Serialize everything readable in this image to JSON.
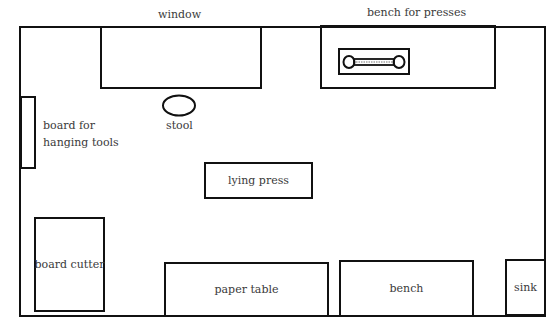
{
  "diagram": {
    "type": "floor-plan",
    "labels": {
      "window": "window",
      "bench_for_presses": "bench for presses",
      "stool": "stool",
      "board_for_tools_line1": "board for",
      "board_for_tools_line2": "hanging tools",
      "lying_press": "lying press",
      "board_cutter": "board cutter",
      "paper_table": "paper table",
      "bench": "bench",
      "sink": "sink"
    },
    "colors": {
      "line": "#111111",
      "text": "#3a3a3a",
      "background": "#ffffff"
    }
  }
}
